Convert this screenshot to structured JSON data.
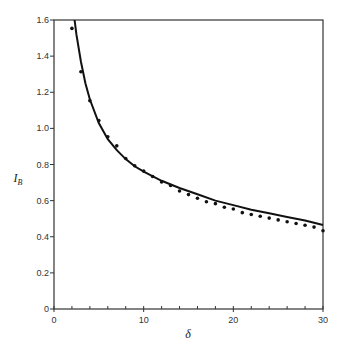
{
  "chart_data": {
    "type": "scatter",
    "title": "",
    "xlabel": "δ",
    "ylabel": "I_B",
    "ylabel_main": "I",
    "ylabel_sub": "B",
    "xlim": [
      0,
      30
    ],
    "ylim": [
      0,
      1.6
    ],
    "x_ticks": [
      0,
      10,
      20,
      30
    ],
    "x_tick_labels": [
      "0",
      "10",
      "20",
      "30"
    ],
    "x_minor_step": 2,
    "y_ticks": [
      0,
      0.2,
      0.4,
      0.6,
      0.8,
      1.0,
      1.2,
      1.4,
      1.6
    ],
    "y_tick_labels": [
      "0",
      "0.2",
      "0.4",
      "0.6",
      "0.8",
      "1.0",
      "1.2",
      "1.4",
      "1.6"
    ],
    "grid": false,
    "legend": null,
    "series": [
      {
        "name": "data points",
        "style": "dots",
        "x": [
          2,
          3,
          4,
          5,
          6,
          7,
          8,
          9,
          10,
          11,
          12,
          13,
          14,
          15,
          16,
          17,
          18,
          19,
          20,
          21,
          22,
          23,
          24,
          25,
          26,
          27,
          28,
          29,
          30
        ],
        "y": [
          1.57,
          1.33,
          1.17,
          1.06,
          0.97,
          0.92,
          0.85,
          0.81,
          0.78,
          0.75,
          0.72,
          0.7,
          0.67,
          0.65,
          0.63,
          0.61,
          0.6,
          0.58,
          0.57,
          0.55,
          0.54,
          0.53,
          0.52,
          0.51,
          0.5,
          0.49,
          0.48,
          0.47,
          0.45
        ]
      },
      {
        "name": "fitted curve",
        "style": "line",
        "x": [
          2.3,
          2.5,
          3,
          3.5,
          4,
          5,
          6,
          7,
          8,
          9,
          10,
          12,
          14,
          16,
          18,
          20,
          22,
          24,
          26,
          28,
          30
        ],
        "y": [
          1.6,
          1.52,
          1.37,
          1.25,
          1.16,
          1.03,
          0.94,
          0.88,
          0.83,
          0.79,
          0.76,
          0.71,
          0.67,
          0.635,
          0.6,
          0.575,
          0.55,
          0.53,
          0.51,
          0.49,
          0.465
        ]
      }
    ]
  },
  "colors": {
    "axis": "#333333",
    "curve": "#111111",
    "points": "#111111"
  }
}
